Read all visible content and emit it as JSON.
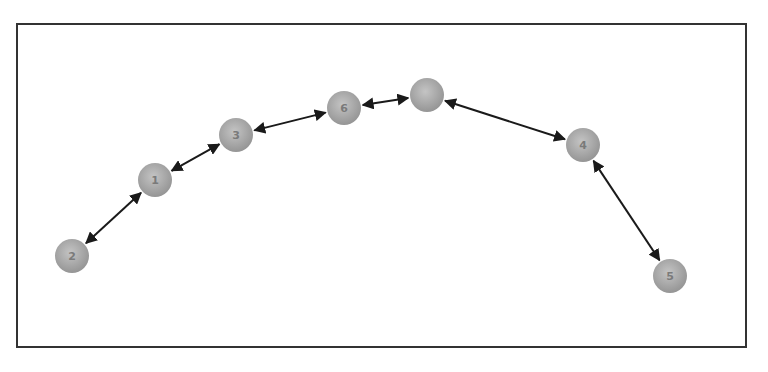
{
  "diagram": {
    "type": "node-chain",
    "node_color": "#a9a9a9",
    "edge_color": "#1a1a1a",
    "frame_color": "#333333",
    "nodes": [
      {
        "id": "n2",
        "label": "2",
        "x": 72,
        "y": 256
      },
      {
        "id": "n1",
        "label": "1",
        "x": 155,
        "y": 180
      },
      {
        "id": "n3",
        "label": "3",
        "x": 236,
        "y": 135
      },
      {
        "id": "n6",
        "label": "6",
        "x": 344,
        "y": 108
      },
      {
        "id": "n7",
        "label": "",
        "x": 427,
        "y": 95
      },
      {
        "id": "n4",
        "label": "4",
        "x": 583,
        "y": 145
      },
      {
        "id": "n5",
        "label": "5",
        "x": 670,
        "y": 276
      }
    ],
    "edges": [
      {
        "from": "n2",
        "to": "n1",
        "bidirectional": true
      },
      {
        "from": "n1",
        "to": "n3",
        "bidirectional": true
      },
      {
        "from": "n3",
        "to": "n6",
        "bidirectional": true
      },
      {
        "from": "n6",
        "to": "n7",
        "bidirectional": true
      },
      {
        "from": "n7",
        "to": "n4",
        "bidirectional": true
      },
      {
        "from": "n4",
        "to": "n5",
        "bidirectional": true
      }
    ]
  }
}
